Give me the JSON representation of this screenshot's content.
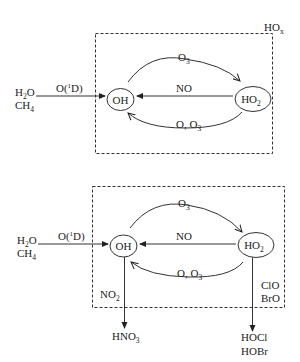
{
  "diagrams": [
    {
      "id": "top",
      "box_label": {
        "main": "HO",
        "sub": "x"
      },
      "sources": {
        "line1_main": "H",
        "line1_sub": "2",
        "line1_tail": "O",
        "line2_main": "CH",
        "line2_sub": "4"
      },
      "source_arrow_label": {
        "main": "O(",
        "sup": "1",
        "tail": "D)"
      },
      "node_left": "OH",
      "node_right": {
        "main": "HO",
        "sub": "2"
      },
      "top_arc_label": {
        "main": "O",
        "sub": "3"
      },
      "middle_arrow_label": "NO",
      "bottom_arc_label": {
        "main": "O, O",
        "sub": "3"
      }
    },
    {
      "id": "bottom",
      "sources": {
        "line1_main": "H",
        "line1_sub": "2",
        "line1_tail": "O",
        "line2_main": "CH",
        "line2_sub": "4"
      },
      "source_arrow_label": {
        "main": "O(",
        "sup": "1",
        "tail": "D)"
      },
      "node_left": "OH",
      "node_right": {
        "main": "HO",
        "sub": "2"
      },
      "top_arc_label": {
        "main": "O",
        "sub": "3"
      },
      "middle_arrow_label": "NO",
      "bottom_arc_label": {
        "main": "O, O",
        "sub": "3"
      },
      "left_sink_label": {
        "main": "NO",
        "sub": "2"
      },
      "left_sink_product": {
        "main": "HNO",
        "sub": "3"
      },
      "right_sink_labels": [
        "ClO",
        "BrO"
      ],
      "right_sink_products": [
        "HOCl",
        "HOBr"
      ]
    }
  ],
  "colors": {
    "line": "#333333",
    "text": "#222222",
    "background": "#ffffff"
  }
}
